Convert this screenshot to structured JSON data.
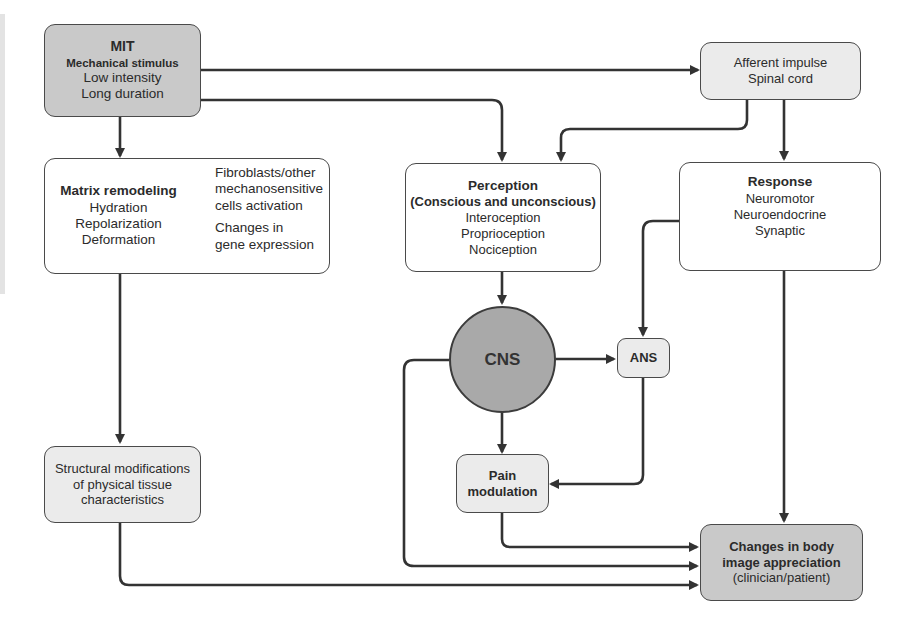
{
  "diagram": {
    "nodes": {
      "mit": {
        "title": "MIT",
        "subtitle": "Mechanical stimulus",
        "lines": [
          "Low intensity",
          "Long duration"
        ],
        "fill": "#c9c9c9"
      },
      "matrix": {
        "title": "Matrix remodeling",
        "lines": [
          "Hydration",
          "Repolarization",
          "Deformation"
        ],
        "bracket_items": [
          "Fibroblasts/other",
          "mechanosensitive",
          "cells activation",
          "Changes in",
          "gene expression"
        ],
        "fill": "#ffffff"
      },
      "afferent": {
        "lines": [
          "Afferent impulse",
          "Spinal cord"
        ],
        "fill": "#ebebeb"
      },
      "perception": {
        "title": "Perception",
        "subtitle": "(Conscious and unconscious)",
        "lines": [
          "Interoception",
          "Proprioception",
          "Nociception"
        ],
        "fill": "#ffffff"
      },
      "response": {
        "title": "Response",
        "lines": [
          "Neuromotor",
          "Neuroendocrine",
          "Synaptic"
        ],
        "fill": "#ffffff"
      },
      "cns": {
        "label": "CNS",
        "fill": "#a9a9a9"
      },
      "ans": {
        "label": "ANS",
        "fill": "#ebebeb"
      },
      "pain": {
        "lines": [
          "Pain",
          "modulation"
        ],
        "fill": "#ebebeb"
      },
      "structural": {
        "lines": [
          "Structural modifications",
          "of physical tissue",
          "characteristics"
        ],
        "fill": "#ebebeb"
      },
      "changes": {
        "lines": [
          "Changes in body",
          "image appreciation"
        ],
        "note": "(clinician/patient)",
        "fill": "#c9c9c9"
      }
    },
    "edges": [
      {
        "from": "MIT",
        "to": "Afferent impulse / Spinal cord"
      },
      {
        "from": "MIT",
        "to": "Perception"
      },
      {
        "from": "MIT",
        "to": "Matrix remodeling"
      },
      {
        "from": "Afferent impulse / Spinal cord",
        "to": "Perception"
      },
      {
        "from": "Afferent impulse / Spinal cord",
        "to": "Response"
      },
      {
        "from": "Matrix remodeling",
        "to": "Structural modifications"
      },
      {
        "from": "Perception",
        "to": "CNS"
      },
      {
        "from": "Response",
        "to": "ANS"
      },
      {
        "from": "Response",
        "to": "Changes in body image appreciation"
      },
      {
        "from": "CNS",
        "to": "ANS"
      },
      {
        "from": "CNS",
        "to": "Pain modulation"
      },
      {
        "from": "ANS",
        "to": "Pain modulation"
      },
      {
        "from": "Pain modulation",
        "to": "Changes in body image appreciation"
      },
      {
        "from": "CNS",
        "to": "Changes in body image appreciation"
      },
      {
        "from": "Structural modifications",
        "to": "Changes in body image appreciation"
      }
    ],
    "colors": {
      "stroke": "#333333",
      "light_fill": "#ebebeb",
      "dark_fill": "#c9c9c9",
      "cns_fill": "#a9a9a9"
    }
  }
}
